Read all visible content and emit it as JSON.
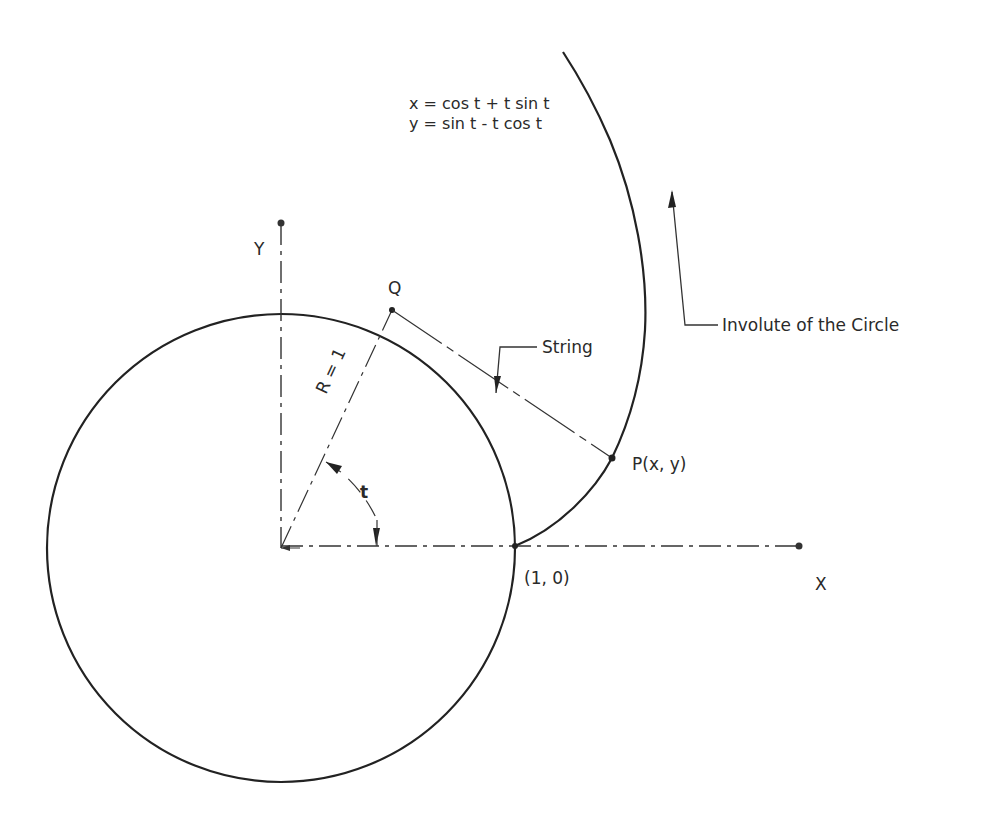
{
  "diagram": {
    "title": "Involute of the Circle",
    "equations": {
      "x": "x = cos t + t sin t",
      "y": "y = sin t - t cos t"
    },
    "labels": {
      "y_axis": "Y",
      "x_axis": "X",
      "point_q": "Q",
      "point_p": "P(x, y)",
      "point_start": "(1, 0)",
      "radius": "R = 1",
      "angle": "t",
      "string": "String",
      "involute": "Involute of the Circle"
    },
    "colors": {
      "line": "#222222",
      "text": "#2a2a2a",
      "background": "#ffffff"
    },
    "geometry": {
      "circle_center": [
        281,
        548
      ],
      "circle_radius": 234,
      "point_q": [
        392,
        310
      ],
      "point_p": [
        612,
        458
      ],
      "point_start": [
        515,
        546
      ],
      "x_axis_end": [
        799,
        546
      ],
      "y_axis_top": [
        281,
        223
      ]
    }
  }
}
